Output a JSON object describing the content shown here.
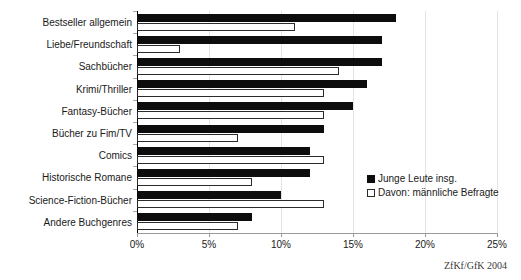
{
  "chart_data": {
    "type": "bar",
    "orientation": "horizontal",
    "title": "",
    "xlabel": "",
    "ylabel": "",
    "xlim": [
      0,
      25
    ],
    "xticks": [
      0,
      5,
      10,
      15,
      20,
      25
    ],
    "xtick_labels": [
      "0%",
      "5%",
      "10%",
      "15%",
      "20%",
      "25%"
    ],
    "grid": true,
    "legend_position": "right-inside",
    "categories": [
      "Bestseller allgemein",
      "Liebe/Freundschaft",
      "Sachbücher",
      "Krimi/Thriller",
      "Fantasy-Bücher",
      "Bücher zu Fim/TV",
      "Comics",
      "Historische Romane",
      "Science-Fiction-Bücher",
      "Andere Buchgenres"
    ],
    "series": [
      {
        "name": "Junge Leute insg.",
        "color": "#0d0d0d",
        "style": "filled",
        "values": [
          18,
          17,
          17,
          16,
          15,
          13,
          12,
          12,
          10,
          8
        ]
      },
      {
        "name": "Davon: männliche Befragte",
        "color": "#ffffff",
        "style": "outlined",
        "values": [
          11,
          3,
          14,
          13,
          13,
          7,
          13,
          8,
          13,
          7
        ]
      }
    ]
  },
  "legend": {
    "items": [
      {
        "label": "Junge Leute insg.",
        "swatch": "filled-black-square"
      },
      {
        "label": "Davon: männliche Befragte",
        "swatch": "outlined-white-square"
      }
    ]
  },
  "source": {
    "text": "ZfKf/GfK 2004"
  }
}
